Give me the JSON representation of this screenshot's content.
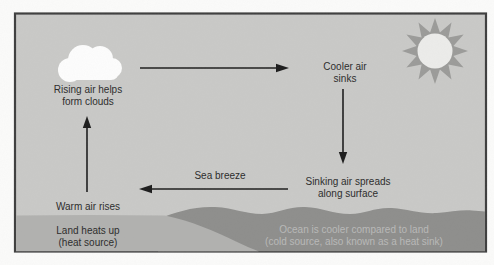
{
  "figure": {
    "type": "sea-breeze-convection-cycle-diagram",
    "labels": {
      "rising_air": {
        "line1": "Rising air helps",
        "line2": "form clouds"
      },
      "cooler_air": {
        "line1": "Cooler air",
        "line2": "sinks"
      },
      "sea_breeze": "Sea breeze",
      "sinking_air": {
        "line1": "Sinking air spreads",
        "line2": "along surface"
      },
      "warm_air": "Warm air rises",
      "land": {
        "line1": "Land heats up",
        "line2": "(heat source)"
      },
      "ocean": {
        "line1": "Ocean is cooler compared to land",
        "line2": "(cold source, also known as a heat sink)"
      }
    },
    "colors": {
      "page_bg": "#fbfbfa",
      "sky": "#c9c9c7",
      "land": "#b1b1af",
      "ocean": "#8e8e8c",
      "sun_rays": "#9b9b99",
      "sun_disk": "#ececea",
      "cloud": "#fdfdfd",
      "border": "#3e3e3e",
      "text": "#2b2b2b",
      "ocean_text": "#b9b9b8",
      "arrow": "#1c1c1c"
    }
  }
}
